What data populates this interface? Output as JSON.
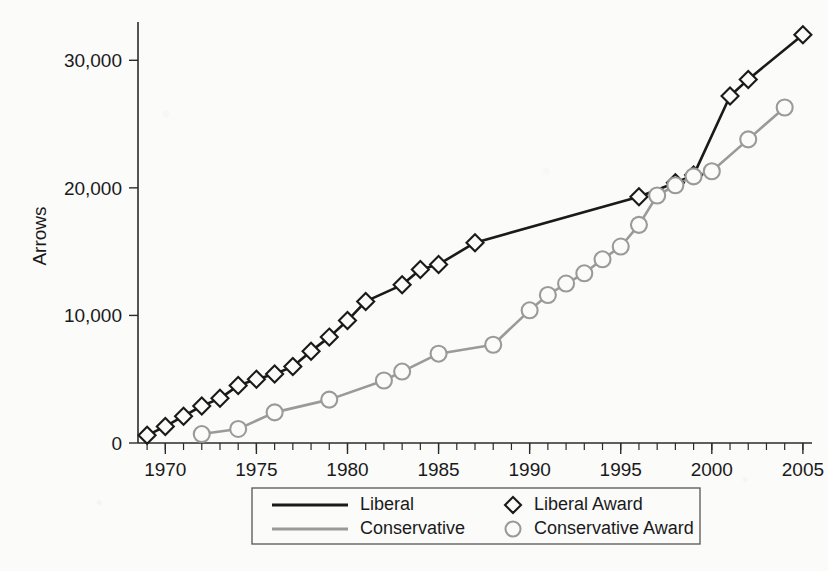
{
  "chart_data": {
    "type": "line",
    "title": "",
    "xlabel": "",
    "ylabel": "Arrows",
    "xlim": [
      1968.5,
      2005.5
    ],
    "ylim": [
      0,
      33000
    ],
    "grid": false,
    "legend_position": "bottom-center",
    "y_ticks": [
      0,
      10000,
      20000,
      30000
    ],
    "y_tick_labels": [
      "0",
      "10,000",
      "20,000",
      "30,000"
    ],
    "x_ticks": [
      1970,
      1975,
      1980,
      1985,
      1990,
      1995,
      2000,
      2005
    ],
    "x_tick_labels": [
      "1970",
      "1975",
      "1980",
      "1985",
      "1990",
      "1995",
      "2000",
      "2005"
    ],
    "x_minor_tick_step": 1,
    "x_minor_tick_range": [
      1969,
      2005
    ],
    "series": [
      {
        "name": "Liberal",
        "legend_label": "Liberal",
        "marker_legend_label": "Liberal Award",
        "color": "#1a1a1a",
        "marker": "diamond",
        "x": [
          1969,
          1970,
          1971,
          1972,
          1973,
          1974,
          1975,
          1976,
          1977,
          1978,
          1979,
          1980,
          1981,
          1983,
          1984,
          1985,
          1987,
          1996,
          1998,
          1999,
          2001,
          2002,
          2005
        ],
        "values": [
          600,
          1300,
          2100,
          2900,
          3500,
          4500,
          5000,
          5400,
          6000,
          7200,
          8300,
          9600,
          11100,
          12400,
          13600,
          14000,
          15700,
          19300,
          20400,
          21000,
          27200,
          28500,
          32000
        ]
      },
      {
        "name": "Conservative",
        "legend_label": "Conservative",
        "marker_legend_label": "Conservative Award",
        "color": "#9a9a9a",
        "marker": "circle",
        "x": [
          1972,
          1974,
          1976,
          1979,
          1982,
          1983,
          1985,
          1988,
          1990,
          1991,
          1992,
          1993,
          1994,
          1995,
          1996,
          1997,
          1998,
          1999,
          2000,
          2002,
          2004
        ],
        "values": [
          700,
          1100,
          2400,
          3400,
          4900,
          5600,
          7000,
          7700,
          10400,
          11600,
          12500,
          13300,
          14400,
          15400,
          17100,
          19400,
          20200,
          20900,
          21300,
          23800,
          26300
        ]
      }
    ],
    "legend_entries": [
      {
        "label": "Liberal",
        "type": "line",
        "color": "#1a1a1a"
      },
      {
        "label": "Conservative",
        "type": "line",
        "color": "#9a9a9a"
      },
      {
        "label": "Liberal Award",
        "type": "diamond",
        "color": "#1a1a1a"
      },
      {
        "label": "Conservative Award",
        "type": "circle",
        "color": "#9a9a9a"
      }
    ]
  },
  "figure": {
    "background_color": "#fbfbfa",
    "axis_color": "#1a1a1a"
  }
}
